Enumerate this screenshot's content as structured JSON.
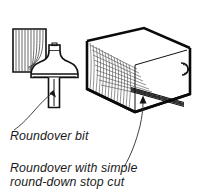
{
  "figure": {
    "kind": "woodworking-line-illustration",
    "background_color": "#ffffff",
    "ink_color": "#111111",
    "captions": [
      {
        "id": "roundover-bit",
        "lines": [
          "Roundover bit"
        ],
        "style": "italic",
        "points_to": "router-bit-shank"
      },
      {
        "id": "roundover-stop-cut",
        "lines": [
          "Roundover with simple",
          "round-down stop cut"
        ],
        "style": "italic",
        "points_to": "board-stop-cut"
      }
    ],
    "objects": [
      {
        "id": "wood-block-profile",
        "label": "wood block end-grain profile",
        "detail": "rounded-over bottom right corner"
      },
      {
        "id": "router-bit",
        "label": "roundover router bit",
        "parts": [
          "pilot bearing",
          "cutter profile",
          "shank"
        ]
      },
      {
        "id": "board",
        "label": "board in isometric view",
        "faces": [
          "end grain",
          "top face",
          "front face"
        ]
      },
      {
        "id": "stop-cut",
        "label": "round-down stop cut along top front edge"
      },
      {
        "id": "rounded-end-detail",
        "label": "rounded-over corner at far end"
      }
    ],
    "leaders": [
      {
        "id": "leader-bit",
        "arrow": "up",
        "target": "router-bit-shank"
      },
      {
        "id": "leader-stop-cut",
        "arrow": "up",
        "target": "board-stop-cut"
      }
    ]
  }
}
